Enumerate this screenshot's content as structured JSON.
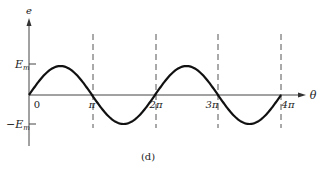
{
  "chart_data": {
    "type": "line",
    "title": "",
    "caption": "(d)",
    "xlabel": "θ",
    "ylabel": "e",
    "function": "e = E_m sin(θ)",
    "x": [
      0,
      0.5,
      1,
      1.5,
      2,
      2.5,
      3,
      3.5,
      4
    ],
    "x_unit": "π",
    "values": [
      0,
      1,
      0,
      -1,
      0,
      1,
      0,
      -1,
      0
    ],
    "y_ticks": [
      "E_m",
      "−E_m"
    ],
    "x_ticks": [
      "0",
      "π",
      "2π",
      "3π",
      "4π"
    ],
    "dashed_verticals_at": [
      "π",
      "2π",
      "3π",
      "4π"
    ],
    "xlim": [
      0,
      4.4
    ],
    "ylim": [
      -1.5,
      2.4
    ],
    "grid": false,
    "legend": null
  },
  "labels": {
    "y_axis": "e",
    "x_axis": "θ",
    "em_pos_base": "E",
    "em_pos_sub": "m",
    "em_neg_base": "−E",
    "em_neg_sub": "m",
    "tick_0": "0",
    "tick_pi": "π",
    "tick_2pi": "2π",
    "tick_3pi": "3π",
    "tick_4pi": "4π",
    "caption": "(d)"
  },
  "colors": {
    "curve": "#111111",
    "axis": "#444444",
    "dash": "#555555"
  }
}
